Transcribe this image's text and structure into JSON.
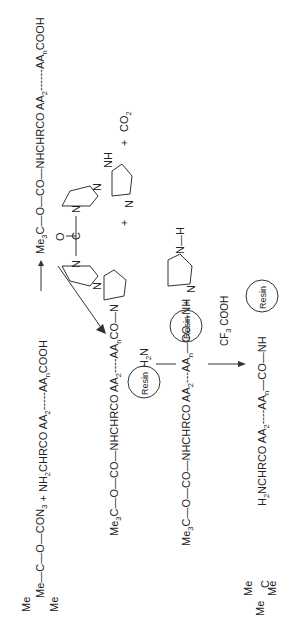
{
  "scheme": {
    "row1": {
      "reagent_a_center": "C",
      "reagent_a_methyls": [
        "Me",
        "Me",
        "Me"
      ],
      "reagent_a_chain": "—O—CON",
      "reagent_a_sub": "3",
      "plus": "+",
      "reagent_b_prefix": "NH",
      "reagent_b_sub": "2",
      "reagent_b_mid": "CHRCO  AA",
      "reagent_b_aa2": "2",
      "reagent_b_dots": "-----AA",
      "reagent_b_n": "n",
      "reagent_b_end": "COOH",
      "product_prefix": "Me",
      "product_sub": "3",
      "product_mid": "C—O—CO—NHCHRCO  AA",
      "product_aa2": "2",
      "product_dots": "------AA",
      "product_n": "n",
      "product_end": "COOH"
    },
    "cdi": {
      "carbonyl": "O",
      "carbon": "C",
      "n1": "N",
      "n2": "N",
      "n3": "N",
      "n4": "N"
    },
    "byproducts": {
      "plus1": "+",
      "imidazole_n": "N",
      "imidazole_nh": "NH",
      "plus2": "+",
      "co2": "CO",
      "co2_sub": "2"
    },
    "row2": {
      "prefix": "Me",
      "sub": "3",
      "mid": "C—O—CO—NHCHRCO  AA",
      "aa2": "2",
      "dots": "----AA",
      "n": "n",
      "end": "CO—N",
      "reagent_h2n": "H",
      "reagent_h2n_sub": "2",
      "reagent_h2n_end": "N",
      "resin": "Resin"
    },
    "row2_byproduct": {
      "plus": "+",
      "imid_n": "N",
      "imid_nh": "N—H"
    },
    "row3": {
      "prefix": "Me",
      "sub": "3",
      "mid": "C—O—CO—NHCHRCO  AA",
      "aa2": "2",
      "dots": "---AA",
      "n": "n",
      "end": "—CO—NH",
      "resin": "Resin",
      "reagent": "CF",
      "reagent_sub": "3",
      "reagent_end": "COOH"
    },
    "row4": {
      "prefix": "H",
      "sub": "2",
      "mid": "NCHRCO  AA",
      "aa2": "2",
      "dots": "----AA",
      "n": "n",
      "end": "—CO—NH",
      "resin": "Resin"
    }
  }
}
